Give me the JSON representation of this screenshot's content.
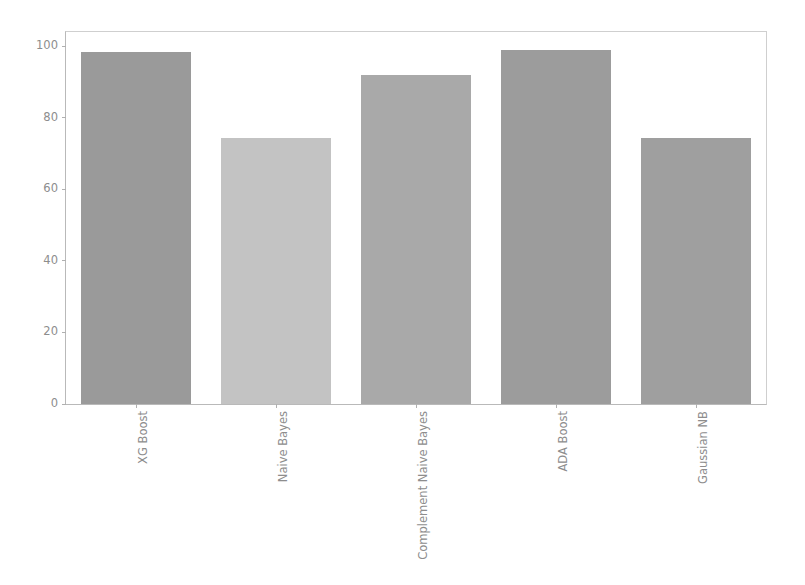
{
  "chart_data": {
    "type": "bar",
    "title": "",
    "subtitle": "",
    "xlabel": "",
    "ylabel": "",
    "categories": [
      "XG Boost",
      "Naive Bayes",
      "Complement Naive Bayes",
      "ADA Boost",
      "Gaussian NB"
    ],
    "values": [
      98.5,
      74.5,
      92.0,
      99.0,
      74.5
    ],
    "bar_colors": [
      "#9a9a9a",
      "#c3c3c3",
      "#a9a9a9",
      "#9c9c9c",
      "#9f9f9f"
    ],
    "ylim": [
      0,
      104
    ],
    "xlim": [
      0,
      5
    ],
    "yticks": [
      0,
      20,
      40,
      60,
      80,
      100
    ],
    "ytick_labels": [
      "0",
      "20",
      "40",
      "60",
      "80",
      "100"
    ],
    "grid": false,
    "legend": null,
    "legend_position": "none",
    "annotations": [],
    "axis_color": "#b9b9b9",
    "tick_label_color": "#8d8d8d",
    "background": "#ffffff"
  }
}
